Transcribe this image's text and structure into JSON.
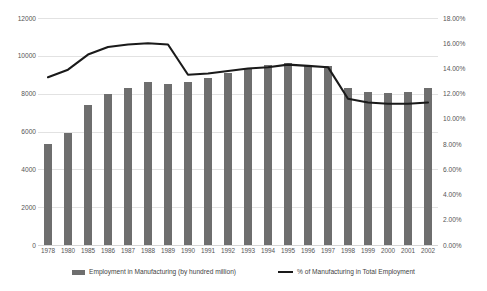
{
  "chart_data": {
    "type": "bar",
    "title": "",
    "subtitle": "",
    "xlabel": "",
    "ylabel": "",
    "grid": true,
    "legend_position": "bottom",
    "categories": [
      "1978",
      "1980",
      "1985",
      "1986",
      "1987",
      "1988",
      "1989",
      "1990",
      "1991",
      "1992",
      "1993",
      "1994",
      "1995",
      "1996",
      "1997",
      "1998",
      "1999",
      "2000",
      "2001",
      "2002"
    ],
    "axes": {
      "left": {
        "label": "",
        "ylim": [
          0,
          12000
        ],
        "tick_step": 2000,
        "ticks": [
          "0",
          "2000",
          "4000",
          "6000",
          "8000",
          "10000",
          "12000"
        ],
        "tick_values": [
          0,
          2000,
          4000,
          6000,
          8000,
          10000,
          12000
        ]
      },
      "right": {
        "label": "",
        "ylim": [
          0,
          18
        ],
        "tick_step": 2,
        "ticks": [
          "0.00%",
          "2.00%",
          "4.00%",
          "6.00%",
          "8.00%",
          "10.00%",
          "12.00%",
          "14.00%",
          "16.00%",
          "18.00%"
        ],
        "tick_values": [
          0,
          2,
          4,
          6,
          8,
          10,
          12,
          14,
          16,
          18
        ]
      }
    },
    "series": [
      {
        "name": "Employment in Manufacturing (by hundred million)",
        "type": "bar",
        "axis": "left",
        "color": "#6e6e6e",
        "values": [
          5340,
          5940,
          7420,
          8000,
          8300,
          8620,
          8510,
          8600,
          8830,
          9080,
          9320,
          9510,
          9610,
          9500,
          9450,
          8300,
          8100,
          8040,
          8080,
          8310
        ]
      },
      {
        "name": "% of Manufacturing in Total Employment",
        "type": "line",
        "axis": "right",
        "color": "#1a1a1a",
        "values": [
          13.3,
          13.9,
          15.1,
          15.7,
          15.9,
          16.0,
          15.9,
          13.5,
          13.6,
          13.8,
          14.0,
          14.1,
          14.3,
          14.2,
          14.1,
          11.6,
          11.3,
          11.2,
          11.2,
          11.3
        ]
      }
    ]
  },
  "legend": {
    "items": [
      {
        "label": "Employment in Manufacturing (by hundred million)",
        "marker": "bar-swatch"
      },
      {
        "label": "% of Manufacturing in Total Employment",
        "marker": "line-swatch"
      }
    ]
  }
}
